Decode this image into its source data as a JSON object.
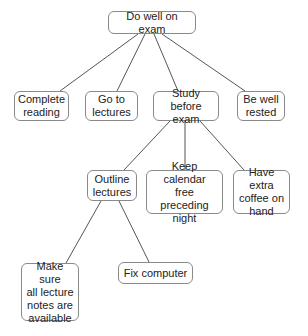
{
  "diagram": {
    "type": "tree",
    "root": {
      "id": "root",
      "label": "Do well on exam"
    },
    "nodes": [
      {
        "id": "root",
        "label": "Do well on exam",
        "x": 108,
        "y": 11,
        "w": 88,
        "h": 23
      },
      {
        "id": "complete-reading",
        "label": "Complete\nreading",
        "x": 14,
        "y": 91,
        "w": 55,
        "h": 30
      },
      {
        "id": "go-to-lectures",
        "label": "Go to\nlectures",
        "x": 85,
        "y": 91,
        "w": 53,
        "h": 30
      },
      {
        "id": "study-before-exam",
        "label": "Study before\nexam",
        "x": 153,
        "y": 91,
        "w": 66,
        "h": 30
      },
      {
        "id": "be-well-rested",
        "label": "Be well\nrested",
        "x": 237,
        "y": 91,
        "w": 48,
        "h": 30
      },
      {
        "id": "outline-lectures",
        "label": "Outline\nlectures",
        "x": 87,
        "y": 170,
        "w": 50,
        "h": 31
      },
      {
        "id": "keep-calendar",
        "label": "Keep calendar\nfree preceding\nnight",
        "x": 146,
        "y": 170,
        "w": 77,
        "h": 44
      },
      {
        "id": "extra-coffee",
        "label": "Have extra\ncoffee on\nhand",
        "x": 233,
        "y": 170,
        "w": 57,
        "h": 44
      },
      {
        "id": "lecture-notes",
        "label": "Make sure\nall lecture\nnotes are\navailable",
        "x": 21,
        "y": 263,
        "w": 58,
        "h": 58
      },
      {
        "id": "fix-computer",
        "label": "Fix computer",
        "x": 118,
        "y": 262,
        "w": 75,
        "h": 22
      }
    ],
    "edges": [
      {
        "from": "root",
        "to": "complete-reading",
        "x1": 138,
        "y1": 34,
        "x2": 60,
        "y2": 91
      },
      {
        "from": "root",
        "to": "go-to-lectures",
        "x1": 145,
        "y1": 34,
        "x2": 117,
        "y2": 91
      },
      {
        "from": "root",
        "to": "study-before-exam",
        "x1": 154,
        "y1": 34,
        "x2": 178,
        "y2": 91
      },
      {
        "from": "root",
        "to": "be-well-rested",
        "x1": 162,
        "y1": 34,
        "x2": 245,
        "y2": 91
      },
      {
        "from": "study-before-exam",
        "to": "outline-lectures",
        "x1": 170,
        "y1": 121,
        "x2": 124,
        "y2": 170
      },
      {
        "from": "study-before-exam",
        "to": "keep-calendar",
        "x1": 185,
        "y1": 121,
        "x2": 185,
        "y2": 170
      },
      {
        "from": "study-before-exam",
        "to": "extra-coffee",
        "x1": 200,
        "y1": 121,
        "x2": 244,
        "y2": 170
      },
      {
        "from": "outline-lectures",
        "to": "lecture-notes",
        "x1": 101,
        "y1": 201,
        "x2": 66,
        "y2": 263
      },
      {
        "from": "outline-lectures",
        "to": "fix-computer",
        "x1": 119,
        "y1": 201,
        "x2": 149,
        "y2": 262
      }
    ]
  }
}
